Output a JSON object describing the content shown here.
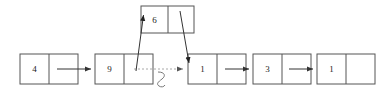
{
  "diagram": {
    "background_color": "#ffffff",
    "node_stroke_color": "#555555",
    "arrow_color": "#333333",
    "dotted_arrow_color": "#a8a8a8",
    "crossout_color": "#777777",
    "list_nodes": [
      {
        "id": "node-4",
        "value": "4",
        "x": 20,
        "y": 54,
        "width": 58,
        "height": 30,
        "split": 29
      },
      {
        "id": "node-9",
        "value": "9",
        "x": 95,
        "y": 54,
        "width": 58,
        "height": 30,
        "split": 29
      },
      {
        "id": "node-1a",
        "value": "1",
        "x": 188,
        "y": 54,
        "width": 58,
        "height": 30,
        "split": 29
      },
      {
        "id": "node-3",
        "value": "3",
        "x": 253,
        "y": 54,
        "width": 58,
        "height": 30,
        "split": 29
      },
      {
        "id": "node-1b",
        "value": "1",
        "x": 317,
        "y": 54,
        "width": 58,
        "height": 30,
        "split": 29
      }
    ],
    "inserted_node": {
      "id": "node-6",
      "value": "6",
      "x": 141,
      "y": 6,
      "width": 53,
      "height": 27,
      "split": 27
    },
    "solid_links": [
      {
        "id": "link-4-to-9",
        "from": "node-4",
        "to": "node-9",
        "x1": 57,
        "y1": 69,
        "x2": 93,
        "y2": 69
      },
      {
        "id": "link-1a-to-3",
        "from": "node-1a",
        "to": "node-3",
        "x1": 225,
        "y1": 69,
        "x2": 251,
        "y2": 69
      },
      {
        "id": "link-3-to-1b",
        "from": "node-3",
        "to": "node-1b",
        "x1": 289,
        "y1": 69,
        "x2": 315,
        "y2": 69
      }
    ],
    "dotted_link": {
      "id": "link-9-to-1a-old",
      "label": "old pointer (removed)",
      "from": "node-9",
      "to": "node-1a",
      "x1": 134,
      "y1": 69,
      "x2": 186,
      "y2": 69
    },
    "diagonal_links": [
      {
        "id": "link-9-to-6",
        "from": "node-9",
        "to": "node-6",
        "x1": 136,
        "y1": 70,
        "x2": 144,
        "y2": 14
      },
      {
        "id": "link-6-to-1a",
        "from": "node-6",
        "to": "node-1a",
        "x1": 180,
        "y1": 12,
        "x2": 189,
        "y2": 66
      }
    ],
    "crossout_mark": {
      "id": "pointer-crossout",
      "cx": 162,
      "cy": 78
    }
  }
}
